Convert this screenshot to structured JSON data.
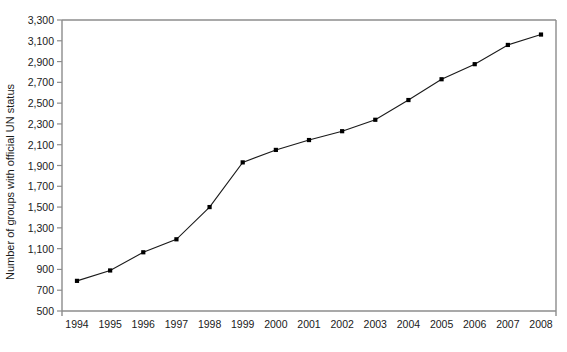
{
  "chart_data": {
    "type": "line",
    "title": "",
    "subtitle": "",
    "xlabel": "",
    "ylabel": "Number of groups with official UN status",
    "categories": [
      "1994",
      "1995",
      "1996",
      "1997",
      "1998",
      "1999",
      "2000",
      "2001",
      "2002",
      "2003",
      "2004",
      "2005",
      "2006",
      "2007",
      "2008"
    ],
    "x": [
      1994,
      1995,
      1996,
      1997,
      1998,
      1999,
      2000,
      2001,
      2002,
      2003,
      2004,
      2005,
      2006,
      2007,
      2008
    ],
    "values": [
      790,
      890,
      1065,
      1190,
      1500,
      1930,
      2050,
      2145,
      2230,
      2340,
      2530,
      2730,
      2875,
      3060,
      3160
    ],
    "series": [
      {
        "name": "Number of groups with official UN status",
        "values": [
          790,
          890,
          1065,
          1190,
          1500,
          1930,
          2050,
          2145,
          2230,
          2340,
          2530,
          2730,
          2875,
          3060,
          3160
        ]
      }
    ],
    "ylim": [
      500,
      3300
    ],
    "y_ticks": [
      500,
      700,
      900,
      1100,
      1300,
      1500,
      1700,
      1900,
      2100,
      2300,
      2500,
      2700,
      2900,
      3100,
      3300
    ],
    "y_tick_labels": [
      "500",
      "700",
      "900",
      "1,100",
      "1,300",
      "1,500",
      "1,700",
      "1,900",
      "2,100",
      "2,300",
      "2,500",
      "2,700",
      "2,900",
      "3,100",
      "3,300"
    ],
    "x_tick_labels": [
      "1994",
      "1995",
      "1996",
      "1997",
      "1998",
      "1999",
      "2000",
      "2001",
      "2002",
      "2003",
      "2004",
      "2005",
      "2006",
      "2007",
      "2008"
    ],
    "grid": false,
    "legend": "none",
    "marker": "square",
    "line_color": "#1a1a1a",
    "marker_color": "#000000",
    "axis_color": "#808080",
    "background_color": "#ffffff"
  }
}
